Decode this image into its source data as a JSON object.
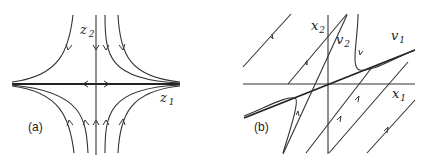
{
  "figure": {
    "panels": [
      {
        "id": "a",
        "label": "(a)",
        "axes": {
          "horizontal": {
            "name": "z",
            "subscript": "1"
          },
          "vertical": {
            "name": "z",
            "subscript": "2"
          }
        },
        "description": "Saddle phase portrait in eigen-coordinates: trajectories approach along z2 axis and leave along z1 axis"
      },
      {
        "id": "b",
        "label": "(b)",
        "axes": {
          "horizontal": {
            "name": "x",
            "subscript": "1"
          },
          "vertical": {
            "name": "x",
            "subscript": "2"
          }
        },
        "eigenvectors": [
          {
            "name": "v",
            "subscript": "1"
          },
          {
            "name": "v",
            "subscript": "2"
          }
        ],
        "description": "Saddle phase portrait in original coordinates with eigenvector directions v1 and v2"
      }
    ],
    "colors": {
      "line": "#333333",
      "background": "#ffffff"
    }
  }
}
